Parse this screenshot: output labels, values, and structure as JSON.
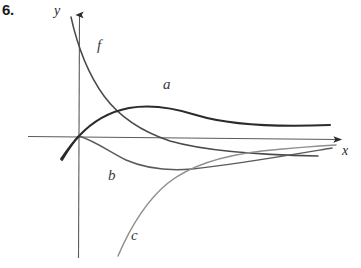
{
  "figure": {
    "problem_number": "6.",
    "axes": {
      "y_label": "y",
      "x_label": "x",
      "origin": {
        "x": 79,
        "y": 136
      },
      "x_axis_color": "#555555",
      "y_axis_color": "#555555"
    },
    "curves": [
      {
        "id": "f",
        "label": "f",
        "color": "#4a4a4a",
        "description": "steeply decreasing curve from upper left, crossing x-axis and flattening toward lower right"
      },
      {
        "id": "a",
        "label": "a",
        "color": "#2b2b2b",
        "description": "dark curve rising through origin to a maximum then slowly decreasing, staying above x-axis"
      },
      {
        "id": "b",
        "label": "b",
        "color": "#5a5a5a",
        "description": "curve decreasing from origin to a minimum below x-axis then rising back toward the axis"
      },
      {
        "id": "c",
        "label": "c",
        "color": "#8a8a8a",
        "description": "curve rising steeply from lower left, flattening out below and approaching the x-axis from below"
      }
    ]
  }
}
